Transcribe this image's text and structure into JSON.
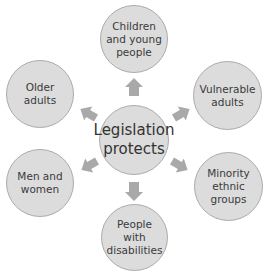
{
  "diagram": {
    "center": {
      "label": "Legislation\nprotects"
    },
    "nodes": [
      {
        "id": "top",
        "label": "Children\nand young\npeople"
      },
      {
        "id": "upper-right",
        "label": "Vulnerable\nadults"
      },
      {
        "id": "lower-right",
        "label": "Minority\nethnic\ngroups"
      },
      {
        "id": "bottom",
        "label": "People\nwith\ndisabilities"
      },
      {
        "id": "lower-left",
        "label": "Men and\nwomen"
      },
      {
        "id": "upper-left",
        "label": "Older\nadults"
      }
    ],
    "colors": {
      "node_fill": "#dcdcdc",
      "node_border": "#ababab",
      "arrow": "#a9a9a9",
      "text": "#3a3a3a"
    }
  }
}
